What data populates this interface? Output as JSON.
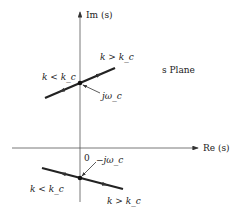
{
  "diagram": {
    "title": "s Plane",
    "axes": {
      "imaginary_label": "Im (s)",
      "real_label": "Re (s)",
      "origin_label": "0"
    },
    "upper_branch": {
      "crossing_label": "jω_c",
      "left_label": "k < k_c",
      "right_label": "k > k_c"
    },
    "lower_branch": {
      "crossing_label": "−jω_c",
      "left_label": "k < k_c",
      "right_label": "k > k_c"
    }
  }
}
